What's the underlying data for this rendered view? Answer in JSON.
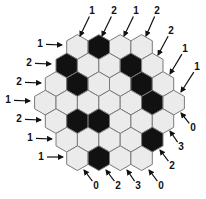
{
  "puzzle": {
    "type": "hexagonal-shading-puzzle",
    "rows": [
      [
        "white",
        "black",
        "white",
        "white"
      ],
      [
        "black",
        "white",
        "white",
        "black",
        "white"
      ],
      [
        "white",
        "black",
        "white",
        "white",
        "black",
        "white"
      ],
      [
        "white",
        "white",
        "white",
        "white",
        "white",
        "black",
        "white"
      ],
      [
        "white",
        "black",
        "black",
        "white",
        "white",
        "white"
      ],
      [
        "white",
        "white",
        "white",
        "white",
        "black"
      ],
      [
        "white",
        "black",
        "white",
        "white"
      ]
    ],
    "colors": {
      "white": "#ebebeb",
      "black": "#111111",
      "border": "#7a7a7a",
      "arrow": "#111111"
    },
    "clues": {
      "top": [
        {
          "label": "1",
          "x": 92,
          "y": 14,
          "ax": 80,
          "ay": 36
        },
        {
          "label": "2",
          "x": 114,
          "y": 14,
          "ax": 102,
          "ay": 36
        },
        {
          "label": "1",
          "x": 136,
          "y": 14,
          "ax": 124,
          "ay": 36
        },
        {
          "label": "2",
          "x": 157,
          "y": 14,
          "ax": 146,
          "ay": 36
        }
      ],
      "upper_right": [
        {
          "label": "2",
          "x": 171,
          "y": 34,
          "ax": 158,
          "ay": 55
        },
        {
          "label": "1",
          "x": 185,
          "y": 52,
          "ax": 170,
          "ay": 74
        },
        {
          "label": "1",
          "x": 197,
          "y": 70,
          "ax": 181,
          "ay": 92
        }
      ],
      "left": [
        {
          "label": "1",
          "x": 40,
          "y": 47,
          "ax": 62,
          "ay": 45
        },
        {
          "label": "2",
          "x": 29,
          "y": 66,
          "ax": 51,
          "ay": 64
        },
        {
          "label": "2",
          "x": 19,
          "y": 85,
          "ax": 41,
          "ay": 83
        },
        {
          "label": "1",
          "x": 8,
          "y": 103,
          "ax": 30,
          "ay": 101
        },
        {
          "label": "2",
          "x": 19,
          "y": 122,
          "ax": 41,
          "ay": 120
        },
        {
          "label": "1",
          "x": 30,
          "y": 141,
          "ax": 52,
          "ay": 139
        },
        {
          "label": "1",
          "x": 41,
          "y": 160,
          "ax": 63,
          "ay": 157
        }
      ],
      "lower_right": [
        {
          "label": "0",
          "x": 193,
          "y": 131,
          "ax": 181,
          "ay": 113
        },
        {
          "label": "3",
          "x": 181,
          "y": 150,
          "ax": 170,
          "ay": 131
        },
        {
          "label": "2",
          "x": 172,
          "y": 169,
          "ax": 160,
          "ay": 150
        }
      ],
      "bottom": [
        {
          "label": "0",
          "x": 96,
          "y": 189,
          "ax": 84,
          "ay": 170
        },
        {
          "label": "2",
          "x": 118,
          "y": 189,
          "ax": 106,
          "ay": 170
        },
        {
          "label": "3",
          "x": 138,
          "y": 189,
          "ax": 127,
          "ay": 170
        },
        {
          "label": "0",
          "x": 161,
          "y": 189,
          "ax": 149,
          "ay": 170
        }
      ]
    }
  }
}
